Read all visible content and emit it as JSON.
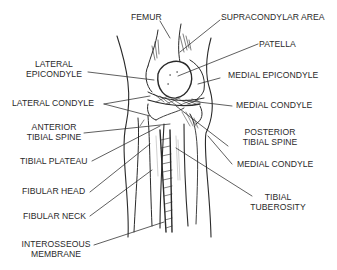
{
  "diagram": {
    "labels": {
      "femur": "FEMUR",
      "supracondylar_area": "SUPRACONDYLAR AREA",
      "patella": "PATELLA",
      "lateral_epicondyle_1": "LATERAL",
      "lateral_epicondyle_2": "EPICONDYLE",
      "medial_epicondyle": "MEDIAL EPICONDYLE",
      "lateral_condyle": "LATERAL CONDYLE",
      "medial_condyle_upper": "MEDIAL CONDYLE",
      "anterior_tibial_spine_1": "ANTERIOR",
      "anterior_tibial_spine_2": "TIBIAL SPINE",
      "posterior_tibial_spine_1": "POSTERIOR",
      "posterior_tibial_spine_2": "TIBIAL SPINE",
      "tibial_plateau": "TIBIAL PLATEAU",
      "medial_condyle_lower": "MEDIAL CONDYLE",
      "fibular_head": "FIBULAR HEAD",
      "tibial_tuberosity_1": "TIBIAL",
      "tibial_tuberosity_2": "TUBEROSITY",
      "fibular_neck": "FIBULAR NECK",
      "interosseous_membrane_1": "INTEROSSEOUS",
      "interosseous_membrane_2": "MEMBRANE"
    },
    "colors": {
      "ink": "#2a2a2a",
      "background": "#ffffff"
    }
  }
}
